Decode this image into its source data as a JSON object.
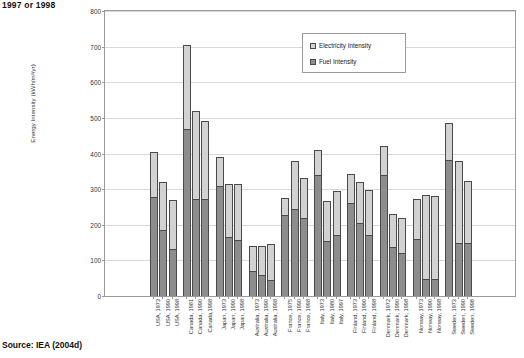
{
  "caption": "1997 or 1998",
  "source": "Source: IEA (2004d)",
  "legend": {
    "electricity": "Electricity Intensity",
    "fuel": "Fuel Intensity"
  },
  "colors": {
    "electricity": "#d2d2d2",
    "fuel": "#8d8d8d",
    "outline": "#4a4a4a",
    "grid": "#d8d8d8",
    "axis": "#9a9a9a"
  },
  "chart_data": {
    "type": "bar",
    "subtype": "stacked",
    "title": "1997 or 1998",
    "xlabel": "",
    "ylabel": "Energy Intensity (kWh/m²/yr)",
    "ylim": [
      0,
      800
    ],
    "yticks": [
      0,
      100,
      200,
      300,
      400,
      500,
      600,
      700,
      800
    ],
    "grid": true,
    "legend_position": "top-center",
    "categories": [
      "USA, 1973",
      "USA, 1990",
      "USA, 1998",
      "Canada, 1981",
      "Canada, 1990",
      "Canada,1998",
      "Japan, 1973",
      "Japan, 1990",
      "Japan, 1998",
      "Australia, 1973",
      "Australia, 1990",
      "Australia, 1998",
      "France, 1975",
      "France, 1990",
      "France, 1998",
      "Italy, 1973",
      "Italy, 1980",
      "Italy, 1997",
      "Finland, 1973",
      "Finland, 1990",
      "Finland, 1998",
      "Denmark, 1972",
      "Denmark, 1990",
      "Denmark, 1998",
      "Norway, 1973",
      "Norway, 1990",
      "Norway, 1998",
      "Sweden, 1973",
      "Sweden, 1990",
      "Sweden, 1998"
    ],
    "group_breaks": [
      3,
      6,
      9,
      12,
      15,
      18,
      21,
      24,
      27
    ],
    "series": [
      {
        "name": "Fuel Intensity",
        "values": [
          278,
          185,
          133,
          470,
          272,
          272,
          310,
          165,
          157,
          70,
          58,
          45,
          228,
          243,
          218,
          340,
          155,
          170,
          260,
          205,
          170,
          340,
          138,
          120,
          160,
          48,
          48,
          382,
          150,
          148
        ]
      },
      {
        "name": "Electricity Intensity",
        "values": [
          127,
          136,
          137,
          235,
          248,
          218,
          80,
          150,
          157,
          70,
          82,
          100,
          47,
          137,
          113,
          70,
          112,
          125,
          82,
          115,
          128,
          82,
          92,
          100,
          112,
          235,
          232,
          103,
          228,
          175
        ]
      }
    ],
    "totals": [
      405,
      321,
      270,
      705,
      520,
      490,
      390,
      315,
      314,
      140,
      140,
      145,
      275,
      380,
      331,
      410,
      267,
      295,
      342,
      320,
      298,
      422,
      230,
      220,
      272,
      283,
      280,
      485,
      378,
      323
    ]
  }
}
